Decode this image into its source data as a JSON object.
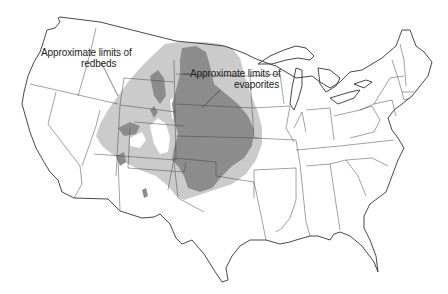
{
  "map": {
    "subject": "Conterminous United States",
    "colors": {
      "background": "#ffffff",
      "redbeds_fill": "#c8c8c8",
      "evaporites_fill": "#8a8a8a",
      "boundary_line": "#333333"
    },
    "legend_labels": {
      "redbeds": {
        "line1": "Approximate limits of",
        "line2": "redbeds"
      },
      "evaporites": {
        "line1": "Approximate limits of",
        "line2": "evaporites"
      }
    },
    "regions": [
      {
        "name": "redbeds",
        "shade": "light gray",
        "extent": "Montana, Wyoming, Colorado, Utah, Arizona, New Mexico, west Texas"
      },
      {
        "name": "evaporites",
        "shade": "dark gray",
        "extent": "North Dakota, South Dakota, Nebraska, Kansas, Oklahoma, Texas panhandle, eastern New Mexico"
      }
    ]
  }
}
